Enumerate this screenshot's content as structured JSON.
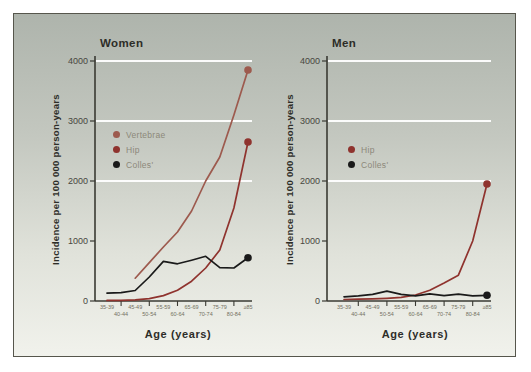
{
  "figure": {
    "ylabel": "Incidence per 100 000 person-years",
    "xlabel": "Age (years)"
  },
  "style": {
    "panel_border": "#56564c",
    "background_top": "#aeb4ac",
    "background_bottom": "#f1f2ec",
    "grid_color": "#ffffff",
    "axis_color": "#3a3a33",
    "title_color": "#2d2d28",
    "ytick_color": "#474740",
    "xtick_color": "#73705f",
    "legend_text_color": "#8c887a",
    "vertebrae_color": "#9d5a4e",
    "hip_color": "#8f332e",
    "colles_color": "#1a1a1a"
  },
  "chart_data": [
    {
      "type": "line",
      "title": "Women",
      "xlabel": "Age (years)",
      "ylabel": "Incidence per 100 000 person-years",
      "categories": [
        "35-39",
        "40-44",
        "45-49",
        "50-54",
        "55-59",
        "60-64",
        "65-69",
        "70-74",
        "75-79",
        "80-84",
        "≥85"
      ],
      "ylim": [
        0,
        4000
      ],
      "yticks": [
        0,
        1000,
        2000,
        3000,
        4000
      ],
      "gridlines": [
        2000,
        3000,
        4000
      ],
      "legend_position": "upper-left-inside",
      "series": [
        {
          "name": "Vertebrae",
          "color": "#9d5a4e",
          "end_dot": true,
          "values": [
            null,
            null,
            380,
            640,
            900,
            1150,
            1500,
            2000,
            2400,
            3100,
            3850
          ]
        },
        {
          "name": "Hip",
          "color": "#8f332e",
          "end_dot": true,
          "values": [
            10,
            10,
            20,
            40,
            90,
            180,
            330,
            550,
            850,
            1550,
            2650
          ]
        },
        {
          "name": "Colles'",
          "color": "#1a1a1a",
          "end_dot": true,
          "values": [
            130,
            140,
            175,
            400,
            660,
            620,
            680,
            745,
            555,
            550,
            720
          ]
        }
      ]
    },
    {
      "type": "line",
      "title": "Men",
      "xlabel": "Age (years)",
      "ylabel": "Incidence per 100 000 person-years",
      "categories": [
        "35-39",
        "40-44",
        "45-49",
        "50-54",
        "55-59",
        "60-64",
        "65-69",
        "70-74",
        "75-79",
        "80-84",
        "≥85"
      ],
      "ylim": [
        0,
        4000
      ],
      "yticks": [
        0,
        1000,
        2000,
        3000,
        4000
      ],
      "gridlines": [
        2000,
        3000,
        4000
      ],
      "legend_position": "upper-left-inside",
      "series": [
        {
          "name": "Hip",
          "color": "#8f332e",
          "end_dot": true,
          "values": [
            25,
            30,
            35,
            45,
            60,
            100,
            180,
            300,
            430,
            1000,
            1950
          ]
        },
        {
          "name": "Colles'",
          "color": "#1a1a1a",
          "end_dot": true,
          "values": [
            70,
            85,
            110,
            165,
            110,
            85,
            120,
            90,
            115,
            85,
            95
          ]
        }
      ]
    }
  ]
}
